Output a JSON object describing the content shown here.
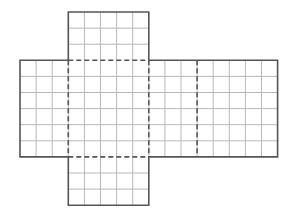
{
  "diagram": {
    "cell_size": 16.1,
    "colors": {
      "background": "#ffffff",
      "grid": "#b8b8b8",
      "outline": "#555555",
      "fold": "#555555"
    },
    "panels": [
      {
        "name": "top",
        "cols": 5,
        "rows": 3
      },
      {
        "name": "left",
        "cols": 3,
        "rows": 6
      },
      {
        "name": "center",
        "cols": 5,
        "rows": 6
      },
      {
        "name": "middle-right",
        "cols": 3,
        "rows": 6
      },
      {
        "name": "right",
        "cols": 5,
        "rows": 6
      },
      {
        "name": "bottom",
        "cols": 5,
        "rows": 3
      }
    ]
  }
}
